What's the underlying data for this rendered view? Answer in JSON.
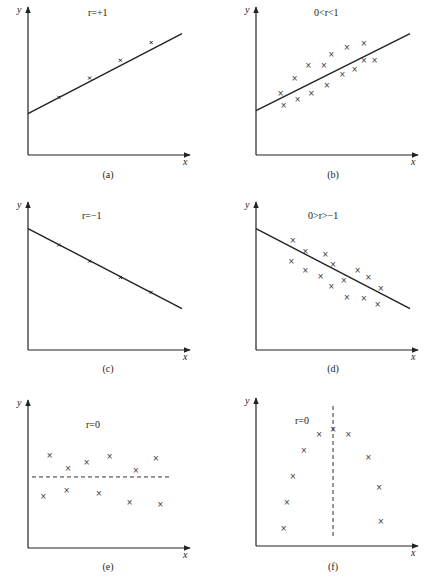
{
  "figure": {
    "panels": [
      {
        "id": "a",
        "caption": "(a)",
        "annotation": "r=+1",
        "x_label": "x",
        "y_label": "y"
      },
      {
        "id": "b",
        "caption": "(b)",
        "annotation": "0<r<1",
        "x_label": "x",
        "y_label": "y"
      },
      {
        "id": "c",
        "caption": "(c)",
        "annotation": "r=−1",
        "x_label": "x",
        "y_label": "y"
      },
      {
        "id": "d",
        "caption": "(d)",
        "annotation": "0>r>−1",
        "x_label": "x",
        "y_label": "y"
      },
      {
        "id": "e",
        "caption": "(e)",
        "annotation": "r=0",
        "x_label": "x",
        "y_label": "y"
      },
      {
        "id": "f",
        "caption": "(f)",
        "annotation": "r=0",
        "x_label": "x",
        "y_label": "y"
      }
    ]
  },
  "chart_data": [
    {
      "type": "scatter",
      "title": "r=+1",
      "caption": "(a)",
      "xlabel": "x",
      "ylabel": "y",
      "line": {
        "style": "solid",
        "from": [
          0,
          0.28
        ],
        "to": [
          1,
          0.82
        ]
      },
      "points": [
        [
          0.2,
          0.39
        ],
        [
          0.4,
          0.52
        ],
        [
          0.6,
          0.64
        ],
        [
          0.8,
          0.76
        ]
      ]
    },
    {
      "type": "scatter",
      "title": "0<r<1",
      "caption": "(b)",
      "xlabel": "x",
      "ylabel": "y",
      "line": {
        "style": "solid",
        "from": [
          0,
          0.3
        ],
        "to": [
          1,
          0.82
        ]
      },
      "points": [
        [
          0.16,
          0.42
        ],
        [
          0.18,
          0.34
        ],
        [
          0.25,
          0.52
        ],
        [
          0.27,
          0.38
        ],
        [
          0.34,
          0.61
        ],
        [
          0.36,
          0.42
        ],
        [
          0.44,
          0.61
        ],
        [
          0.46,
          0.47
        ],
        [
          0.49,
          0.68
        ],
        [
          0.56,
          0.55
        ],
        [
          0.59,
          0.73
        ],
        [
          0.64,
          0.58
        ],
        [
          0.7,
          0.76
        ],
        [
          0.7,
          0.64
        ],
        [
          0.77,
          0.64
        ]
      ]
    },
    {
      "type": "scatter",
      "title": "r=−1",
      "caption": "(c)",
      "xlabel": "x",
      "ylabel": "y",
      "line": {
        "style": "solid",
        "from": [
          0,
          0.82
        ],
        "to": [
          1,
          0.28
        ]
      },
      "points": [
        [
          0.2,
          0.71
        ],
        [
          0.4,
          0.6
        ],
        [
          0.6,
          0.49
        ],
        [
          0.8,
          0.39
        ]
      ]
    },
    {
      "type": "scatter",
      "title": "0>r>−1",
      "caption": "(d)",
      "xlabel": "x",
      "ylabel": "y",
      "line": {
        "style": "solid",
        "from": [
          0,
          0.82
        ],
        "to": [
          1,
          0.28
        ]
      },
      "points": [
        [
          0.24,
          0.74
        ],
        [
          0.23,
          0.6
        ],
        [
          0.32,
          0.67
        ],
        [
          0.32,
          0.54
        ],
        [
          0.45,
          0.65
        ],
        [
          0.42,
          0.5
        ],
        [
          0.5,
          0.58
        ],
        [
          0.49,
          0.43
        ],
        [
          0.57,
          0.47
        ],
        [
          0.59,
          0.36
        ],
        [
          0.66,
          0.54
        ],
        [
          0.73,
          0.49
        ],
        [
          0.7,
          0.35
        ],
        [
          0.81,
          0.42
        ],
        [
          0.79,
          0.31
        ]
      ]
    },
    {
      "type": "scatter",
      "title": "r=0",
      "caption": "(e)",
      "xlabel": "x",
      "ylabel": "y",
      "line": {
        "style": "dashed",
        "orientation": "horizontal",
        "y": 0.48
      },
      "points": [
        [
          0.14,
          0.63
        ],
        [
          0.26,
          0.54
        ],
        [
          0.38,
          0.58
        ],
        [
          0.53,
          0.62
        ],
        [
          0.7,
          0.53
        ],
        [
          0.83,
          0.61
        ],
        [
          0.1,
          0.35
        ],
        [
          0.25,
          0.39
        ],
        [
          0.46,
          0.37
        ],
        [
          0.66,
          0.31
        ],
        [
          0.86,
          0.3
        ]
      ]
    },
    {
      "type": "scatter",
      "title": "r=0",
      "caption": "(f)",
      "xlabel": "x",
      "ylabel": "y",
      "line": {
        "style": "dashed",
        "orientation": "vertical",
        "x": 0.5
      },
      "points": [
        [
          0.18,
          0.12
        ],
        [
          0.2,
          0.3
        ],
        [
          0.24,
          0.47
        ],
        [
          0.31,
          0.65
        ],
        [
          0.41,
          0.76
        ],
        [
          0.5,
          0.79
        ],
        [
          0.6,
          0.76
        ],
        [
          0.73,
          0.6
        ],
        [
          0.8,
          0.4
        ],
        [
          0.81,
          0.17
        ]
      ]
    }
  ]
}
